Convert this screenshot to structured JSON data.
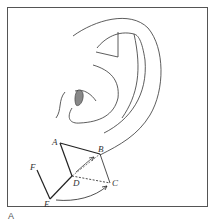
{
  "figure": {
    "panel_label": "A",
    "points": {
      "A": "A",
      "B": "B",
      "C": "C",
      "D": "D",
      "E": "E",
      "F": "F"
    },
    "colors": {
      "line": "#333333",
      "frame": "#555555",
      "shaded": "#888888"
    }
  }
}
